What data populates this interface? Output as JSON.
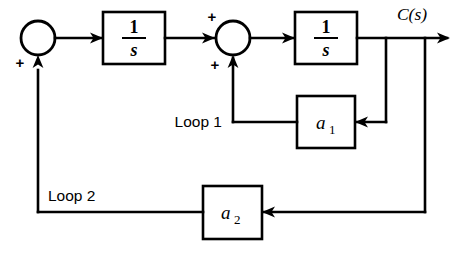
{
  "diagram": {
    "background_color": "#ffffff",
    "line_color": "#000000",
    "blocks": [
      {
        "id": "integrator-1",
        "label_numerator": "1",
        "label_denominator": "s",
        "kind": "transfer-function"
      },
      {
        "id": "integrator-2",
        "label_numerator": "1",
        "label_denominator": "s",
        "kind": "transfer-function"
      },
      {
        "id": "gain-a1",
        "label_base": "a",
        "label_subscript": "1",
        "kind": "gain"
      },
      {
        "id": "gain-a2",
        "label_base": "a",
        "label_subscript": "2",
        "kind": "gain"
      }
    ],
    "summing_junctions": [
      {
        "id": "sum-1",
        "signs": [
          "+"
        ]
      },
      {
        "id": "sum-2",
        "signs": [
          "+",
          "+"
        ]
      }
    ],
    "signs": {
      "sum1_bottom": "+",
      "sum2_left": "+",
      "sum2_bottom": "+"
    },
    "labels": {
      "output": "C(s)",
      "loop1": "Loop 1",
      "loop2": "Loop 2"
    }
  }
}
